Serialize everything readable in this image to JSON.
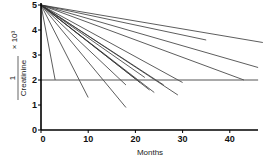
{
  "chart_data": {
    "type": "line",
    "title": "",
    "xlabel": "Months",
    "ylabel": {
      "numerator": "1",
      "denominator": "Creatinine",
      "suffix": "× 10³"
    },
    "xlim": [
      0,
      46
    ],
    "ylim": [
      0,
      5
    ],
    "xticks": [
      0,
      10,
      20,
      30,
      40
    ],
    "yticks": [
      0,
      1,
      2,
      3,
      4,
      5
    ],
    "grid": false,
    "legend": null,
    "reference_line": {
      "y": 2,
      "x_from": 0,
      "x_to": 46
    },
    "series": [
      {
        "name": "patient-1",
        "x": [
          0,
          3
        ],
        "y": [
          5,
          2.0
        ]
      },
      {
        "name": "patient-2",
        "x": [
          0,
          10
        ],
        "y": [
          5,
          1.3
        ]
      },
      {
        "name": "patient-3",
        "x": [
          0,
          18
        ],
        "y": [
          5,
          0.9
        ]
      },
      {
        "name": "patient-4",
        "x": [
          0,
          18
        ],
        "y": [
          5,
          1.8
        ]
      },
      {
        "name": "patient-5",
        "x": [
          0,
          21
        ],
        "y": [
          5,
          1.9
        ]
      },
      {
        "name": "patient-6",
        "x": [
          0,
          22
        ],
        "y": [
          5,
          2.1
        ]
      },
      {
        "name": "patient-7",
        "x": [
          0,
          23
        ],
        "y": [
          5,
          1.6
        ]
      },
      {
        "name": "patient-8",
        "x": [
          0,
          24
        ],
        "y": [
          5,
          1.5
        ]
      },
      {
        "name": "patient-9",
        "x": [
          0,
          26
        ],
        "y": [
          5,
          1.8
        ]
      },
      {
        "name": "patient-10",
        "x": [
          0,
          29
        ],
        "y": [
          5,
          1.4
        ]
      },
      {
        "name": "patient-11",
        "x": [
          0,
          30
        ],
        "y": [
          5,
          1.9
        ]
      },
      {
        "name": "patient-12",
        "x": [
          0,
          35
        ],
        "y": [
          5,
          3.6
        ]
      },
      {
        "name": "patient-13",
        "x": [
          0,
          43
        ],
        "y": [
          5,
          2.0
        ]
      },
      {
        "name": "patient-14",
        "x": [
          0,
          46
        ],
        "y": [
          5,
          2.5
        ]
      },
      {
        "name": "patient-15",
        "x": [
          0,
          47
        ],
        "y": [
          5,
          3.5
        ]
      }
    ]
  }
}
